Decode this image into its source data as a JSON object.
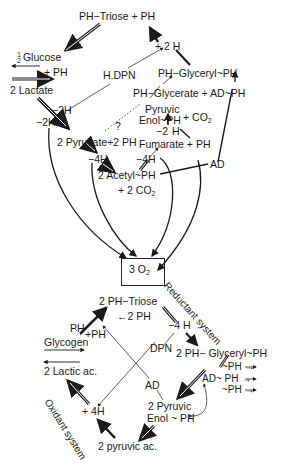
{
  "diagram": {
    "type": "metabolic-cycle-diagram",
    "top_cycle": {
      "nodes": {
        "ph_triose": "PH−Triose + PH",
        "plus_2h": "+ 2 H",
        "half": "1/2",
        "glucose": "Glucose",
        "plus_ph_left": "+ PH",
        "lactate": "2 Lactate",
        "hdpn": "H.DPN",
        "glyceryl": "PH−Glyceryl~PH",
        "glycerate": "PH−Glycerate + AD~PH",
        "minus_2h_a": "−2H",
        "minus_2h_b": "−2H",
        "pyruvic": "Pyruvic",
        "enol": "Enol~PH",
        "plus_co2": "+ CO",
        "co2_sub": "2",
        "pyruvate": "2  Pyruvate+2 PH",
        "question": "?",
        "minus_2h_c": "−2",
        "h_c": "H",
        "fumarate": "Fumarate + PH",
        "minus_4h_a": "−4H",
        "minus_4h_b": "−4H",
        "ad": "AD",
        "acetyl": "2  Acetyl~PH",
        "plus_2co2": "+ 2 CO",
        "co2_sub_2": "2"
      }
    },
    "center": {
      "o2": "3 O",
      "o2_sub": "2"
    },
    "bottom_cycle": {
      "reductant_label": "Reductant  system",
      "oxidant_label": "Oxidant  system",
      "nodes": {
        "triose2": "2  PH−Triose",
        "minus_2ph": "←2 PH",
        "minus_4h": "−4 H",
        "ph": "PH",
        "plus_ph": "+PH",
        "glycogen": "Glycogen",
        "dpn": "DPN",
        "glyceryl2": "2  PH− Glyceryl~PH",
        "lactic": "2  Lactic ac.",
        "ph_out1": "~PH →",
        "ph_out2": "AD~ PH →",
        "ph_out3": "~PH →",
        "ad2": "AD",
        "plus_4h": "+ 4H",
        "pyruvic2": "2  Pyruvic",
        "enol2": "Enol ~ PH",
        "pyruvic_ac": "2  pyruvic ac."
      }
    },
    "colors": {
      "ink": "#1a1a1a",
      "background": "#ffffff"
    }
  }
}
